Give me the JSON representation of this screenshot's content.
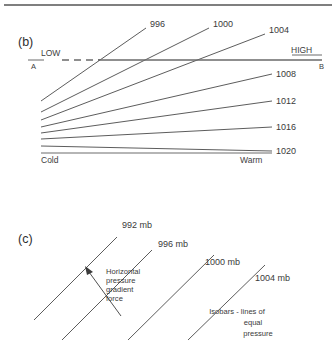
{
  "figure": {
    "panel_b": {
      "label": "(b)",
      "left_end_label": "Cold",
      "right_end_label": "Warm",
      "surface_left_label": "LOW",
      "surface_right_label": "HIGH",
      "cross_section_start": "A",
      "cross_section_end": "B",
      "isobars": [
        {
          "value": "996",
          "x1": 41,
          "y1": 101,
          "x2": 146,
          "y2": 28
        },
        {
          "value": "1000",
          "x1": 41,
          "y1": 112,
          "x2": 209,
          "y2": 28
        },
        {
          "value": "1004",
          "x1": 41,
          "y1": 120,
          "x2": 265,
          "y2": 34
        },
        {
          "value": "1008",
          "x1": 41,
          "y1": 127,
          "x2": 272,
          "y2": 74
        },
        {
          "value": "1012",
          "x1": 41,
          "y1": 133,
          "x2": 272,
          "y2": 101
        },
        {
          "value": "1016",
          "x1": 41,
          "y1": 139,
          "x2": 272,
          "y2": 127
        },
        {
          "value": "1020",
          "x1": 41,
          "y1": 146,
          "x2": 272,
          "y2": 151
        }
      ],
      "surface_line": {
        "x1": 28,
        "y1": 60,
        "x2": 322,
        "y2": 60
      },
      "ground_line": {
        "x1": 41,
        "y1": 153,
        "x2": 272,
        "y2": 153
      }
    },
    "panel_c": {
      "label": "(c)",
      "isobars": [
        {
          "value": "992 mb",
          "x1": 34,
          "y1": 320,
          "x2": 117,
          "y2": 237
        },
        {
          "value": "996 mb",
          "x1": 62,
          "y1": 340,
          "x2": 152,
          "y2": 250
        },
        {
          "value": "1000 mb",
          "x1": 128,
          "y1": 340,
          "x2": 214,
          "y2": 255
        },
        {
          "value": "1004 mb",
          "x1": 188,
          "y1": 340,
          "x2": 265,
          "y2": 265
        }
      ],
      "gradient_force_label": "Horizontal\npressure\ngradient\nforce",
      "gradient_force_lines": [
        "Horizontal",
        "pressure",
        "gradient",
        "force"
      ],
      "isobar_note_lines": [
        "Isobars - lines  of",
        "equal",
        "pressure"
      ],
      "arrow": {
        "x1": 120,
        "y1": 302,
        "x2": 86,
        "y2": 268
      }
    },
    "colors": {
      "line": "#4a4a4a",
      "surface": "#6a6a6a",
      "text": "#3a3a3a",
      "background": "#ffffff"
    }
  }
}
